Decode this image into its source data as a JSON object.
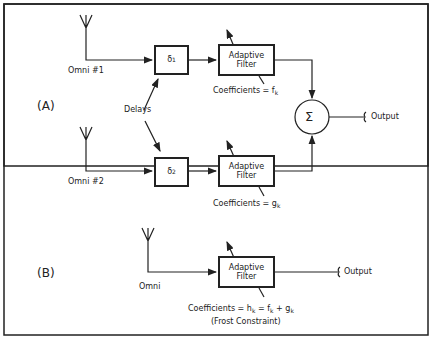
{
  "diagram": {
    "section_a": {
      "label": "(A)",
      "antenna1": {
        "label": "Omni #1"
      },
      "antenna2": {
        "label": "Omni #2"
      },
      "delay1": {
        "symbol": "δ",
        "sub": "1"
      },
      "delay2": {
        "symbol": "δ",
        "sub": "2"
      },
      "delays_label": "Delays",
      "filter1": {
        "line1": "Adaptive",
        "line2": "Filter",
        "coef_prefix": "Coefficients = f",
        "coef_sub": "k"
      },
      "filter2": {
        "line1": "Adaptive",
        "line2": "Filter",
        "coef_prefix": "Coefficients = g",
        "coef_sub": "k"
      },
      "summer": "Σ",
      "output": "Output"
    },
    "section_b": {
      "label": "(B)",
      "antenna": {
        "label": "Omni"
      },
      "filter": {
        "line1": "Adaptive",
        "line2": "Filter"
      },
      "coef": {
        "p1": "Coefficients = h",
        "s1": "k",
        "p2": " = f",
        "s2": "k",
        "p3": " + g",
        "s3": "k"
      },
      "constraint": "(Frost Constraint)",
      "output": "Output"
    }
  }
}
